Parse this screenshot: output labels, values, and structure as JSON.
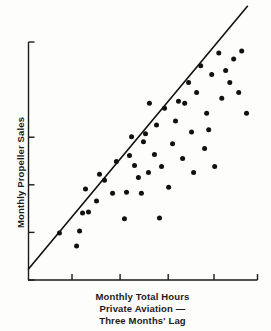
{
  "figure": {
    "background_color": "#fdfdfb",
    "ink_color": "#1a1a1a",
    "width": 271,
    "height": 331
  },
  "axis_titles": {
    "y": "Monthly Propeller Sales",
    "x_line1": "Monthly Total Hours",
    "x_line2": "Private Aviation —",
    "x_line3": "Three Months' Lag"
  },
  "chart_data": {
    "type": "scatter",
    "title": "",
    "xlabel": "Monthly Total Hours Private Aviation — Three Months' Lag",
    "ylabel": "Monthly Propeller Sales",
    "grid": false,
    "legend": false,
    "axis_labels_shown": false,
    "xlim": [
      0,
      100
    ],
    "ylim": [
      0,
      100
    ],
    "x_ticks": [
      19,
      40,
      61,
      81,
      100
    ],
    "y_ticks": [
      0,
      20,
      40,
      60,
      100
    ],
    "x_tick_labels": [],
    "y_tick_labels": [],
    "marker": {
      "shape": "circle",
      "color": "#111111",
      "size_px": 5
    },
    "trendline": {
      "type": "linear-fit",
      "color": "#111111",
      "width_px": 1.6,
      "x_start": 0.0,
      "y_start": 4.6,
      "x_end": 95.6,
      "y_end": 115.0
    },
    "points": [
      {
        "x": 13.5,
        "y": 19.7
      },
      {
        "x": 21.0,
        "y": 14.3
      },
      {
        "x": 22.3,
        "y": 20.6
      },
      {
        "x": 23.6,
        "y": 28.2
      },
      {
        "x": 26.2,
        "y": 28.6
      },
      {
        "x": 24.9,
        "y": 38.2
      },
      {
        "x": 29.7,
        "y": 33.2
      },
      {
        "x": 33.2,
        "y": 41.9
      },
      {
        "x": 36.7,
        "y": 36.5
      },
      {
        "x": 38.4,
        "y": 49.8
      },
      {
        "x": 41.9,
        "y": 25.7
      },
      {
        "x": 42.8,
        "y": 36.9
      },
      {
        "x": 44.1,
        "y": 52.3
      },
      {
        "x": 45.0,
        "y": 60.2
      },
      {
        "x": 46.3,
        "y": 48.1
      },
      {
        "x": 48.0,
        "y": 43.1
      },
      {
        "x": 49.3,
        "y": 36.5
      },
      {
        "x": 51.1,
        "y": 61.4
      },
      {
        "x": 52.4,
        "y": 45.2
      },
      {
        "x": 52.8,
        "y": 74.3
      },
      {
        "x": 55.0,
        "y": 52.7
      },
      {
        "x": 55.9,
        "y": 65.1
      },
      {
        "x": 57.2,
        "y": 26.1
      },
      {
        "x": 58.1,
        "y": 47.7
      },
      {
        "x": 59.4,
        "y": 72.2
      },
      {
        "x": 61.2,
        "y": 39.0
      },
      {
        "x": 62.9,
        "y": 57.3
      },
      {
        "x": 64.2,
        "y": 66.8
      },
      {
        "x": 65.5,
        "y": 75.1
      },
      {
        "x": 67.3,
        "y": 51.0
      },
      {
        "x": 68.2,
        "y": 74.3
      },
      {
        "x": 69.9,
        "y": 83.0
      },
      {
        "x": 71.2,
        "y": 62.2
      },
      {
        "x": 72.1,
        "y": 45.2
      },
      {
        "x": 73.4,
        "y": 78.8
      },
      {
        "x": 75.2,
        "y": 90.0
      },
      {
        "x": 76.9,
        "y": 55.2
      },
      {
        "x": 77.8,
        "y": 70.1
      },
      {
        "x": 78.7,
        "y": 63.1
      },
      {
        "x": 80.0,
        "y": 86.3
      },
      {
        "x": 81.3,
        "y": 47.7
      },
      {
        "x": 83.1,
        "y": 95.4
      },
      {
        "x": 84.4,
        "y": 76.4
      },
      {
        "x": 86.1,
        "y": 88.0
      },
      {
        "x": 87.9,
        "y": 83.0
      },
      {
        "x": 89.6,
        "y": 92.9
      },
      {
        "x": 91.8,
        "y": 78.8
      },
      {
        "x": 93.1,
        "y": 96.2
      },
      {
        "x": 95.2,
        "y": 70.1
      },
      {
        "x": 50.2,
        "y": 58.1
      },
      {
        "x": 31.0,
        "y": 44.4
      }
    ]
  }
}
